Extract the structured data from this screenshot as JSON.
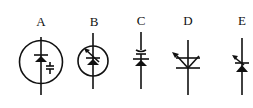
{
  "diagram": {
    "stroke_color": "#111111",
    "background": "#ffffff",
    "symbols": [
      {
        "label": "A",
        "name": "diode-in-circle-with-capacitor"
      },
      {
        "label": "B",
        "name": "variable-diode-in-circle"
      },
      {
        "label": "C",
        "name": "diode-with-capacitor"
      },
      {
        "label": "D",
        "name": "variable-triode-symbol"
      },
      {
        "label": "E",
        "name": "variable-diode"
      }
    ]
  }
}
